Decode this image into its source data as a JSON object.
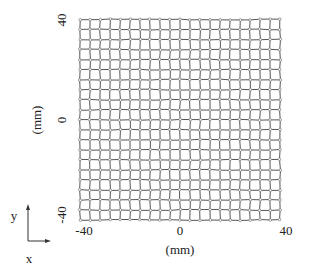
{
  "chart_data": {
    "type": "scatter",
    "title": "",
    "xlabel": "(mm)",
    "ylabel": "(mm)",
    "xlim": [
      -40,
      40
    ],
    "ylim": [
      -40,
      40
    ],
    "x_ticks": [
      "-40",
      "0",
      "40"
    ],
    "y_ticks": [
      "-40",
      "0",
      "40"
    ],
    "grid_step_mm": 4,
    "grid_nodes_per_axis": 21,
    "grid_lines": true,
    "marker": "open-circle",
    "line_color": "#555555",
    "marker_color": "#777777"
  },
  "axes_labels": {
    "y_top": "40",
    "y_mid": "0",
    "y_bottom": "-40",
    "y_unit": "(mm)",
    "x_left": "-40",
    "x_mid": "0",
    "x_right": "40",
    "x_unit": "(mm)"
  },
  "coord_indicator": {
    "x_label": "x",
    "y_label": "y"
  }
}
